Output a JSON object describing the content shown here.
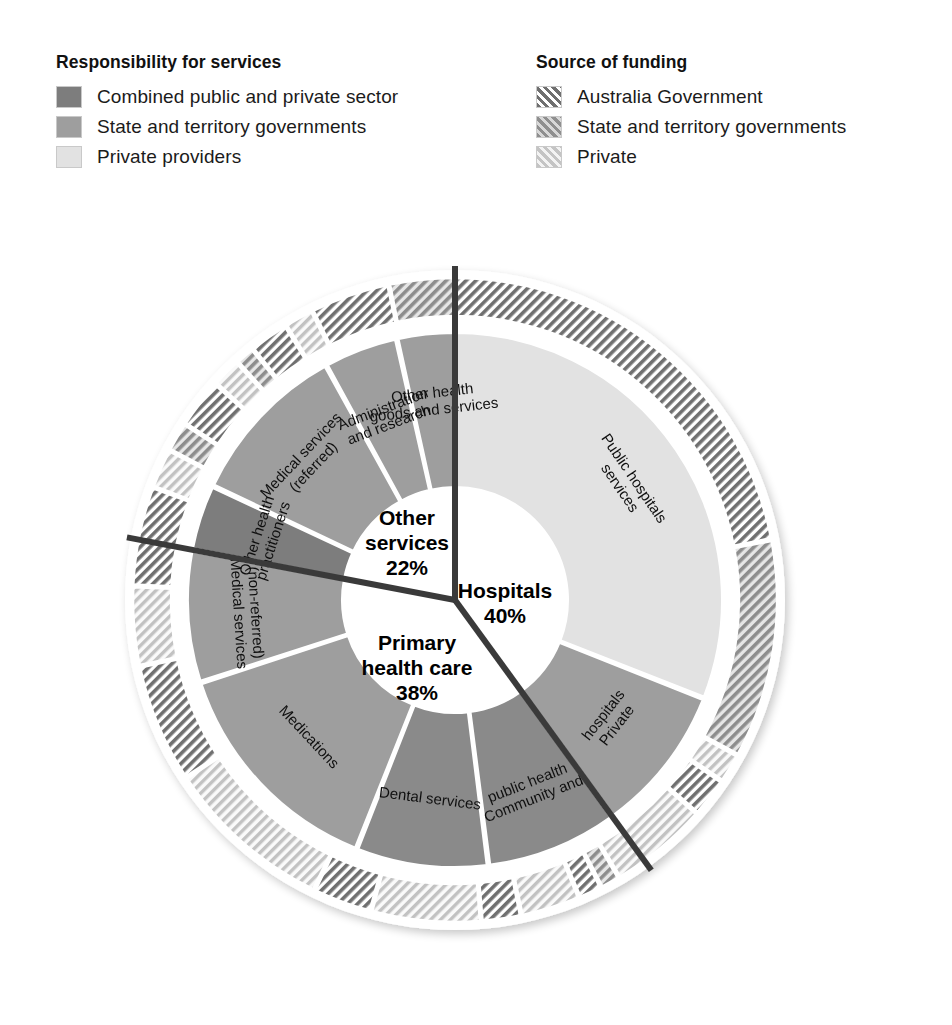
{
  "legends": [
    {
      "id": "responsibility",
      "title": "Responsibility for services",
      "items": [
        {
          "label": "Combined public and private sector",
          "swatch": "dark-gray-solid",
          "color": "#7d7d7d"
        },
        {
          "label": "State and territory governments",
          "swatch": "medium-gray-solid",
          "color": "#9e9e9e"
        },
        {
          "label": "Private providers",
          "swatch": "light-gray-solid",
          "color": "#e2e2e2"
        }
      ]
    },
    {
      "id": "funding",
      "title": "Source of funding",
      "items": [
        {
          "label": "Australia Government",
          "swatch": "dark-gray-hatch",
          "color": "#6f6f6f"
        },
        {
          "label": "State and territory governments",
          "swatch": "medium-gray-hatch",
          "color": "#9a9a9a"
        },
        {
          "label": "Private",
          "swatch": "light-gray-hatch",
          "color": "#dcdcdc"
        }
      ]
    }
  ],
  "chart_data": {
    "type": "pie",
    "title": "",
    "subtype": "sunburst-donut",
    "legend_position": "top",
    "grid": false,
    "center_groups": [
      {
        "name": "Hospitals",
        "value": 40,
        "label": "Hospitals",
        "percent_label": "40%",
        "start_deg": -90,
        "end_deg": 54
      },
      {
        "name": "Primary health care",
        "value": 38,
        "label": "Primary\nhealth care",
        "percent_label": "38%",
        "start_deg": 54,
        "end_deg": 190.8
      },
      {
        "name": "Other services",
        "value": 22,
        "label": "Other\nservices",
        "percent_label": "22%",
        "start_deg": 190.8,
        "end_deg": 270
      }
    ],
    "inner_ring": [
      {
        "label": "Public hospitals services",
        "group": "Hospitals",
        "value": 31.0,
        "responsibility": "State and territory governments",
        "fill": "#e2e2e2"
      },
      {
        "label": "Private hospitals",
        "group": "Hospitals",
        "value": 9.0,
        "responsibility": "Private providers",
        "fill": "#9e9e9e"
      },
      {
        "label": "Community and public health",
        "group": "Primary health care",
        "value": 8.0,
        "responsibility": "Combined public and private sector",
        "fill": "#8a8a8a"
      },
      {
        "label": "Dental services",
        "group": "Primary health care",
        "value": 8.0,
        "responsibility": "Combined public and private sector",
        "fill": "#8a8a8a"
      },
      {
        "label": "Medications",
        "group": "Primary health care",
        "value": 14.0,
        "responsibility": "State and territory governments",
        "fill": "#9e9e9e"
      },
      {
        "label": "Medical services (non-referred)",
        "group": "Primary health care",
        "value": 8.0,
        "responsibility": "State and territory governments",
        "fill": "#9e9e9e"
      },
      {
        "label": "Other health practitioners",
        "group": "Other services",
        "value": 4.0,
        "responsibility": "Combined public and private sector",
        "fill": "#7d7d7d"
      },
      {
        "label": "Medical services (referred)",
        "group": "Other services",
        "value": 10.0,
        "responsibility": "State and territory governments",
        "fill": "#9e9e9e"
      },
      {
        "label": "Administration and research",
        "group": "Other services",
        "value": 4.5,
        "responsibility": "State and territory governments",
        "fill": "#9e9e9e"
      },
      {
        "label": "Other health goods and services",
        "group": "Other services",
        "value": 3.5,
        "responsibility": "State and territory governments",
        "fill": "#9e9e9e"
      }
    ],
    "outer_ring_note": "Funding split per service, hatched bands",
    "outer_ring": [
      {
        "funding": "Australia Government",
        "span": 22.0,
        "fill": "#6f6f6f"
      },
      {
        "funding": "State and territory governments",
        "span": 11.0,
        "fill": "#9a9a9a"
      },
      {
        "funding": "Private",
        "span": 1.5,
        "fill": "#dcdcdc"
      },
      {
        "funding": "Australia Government",
        "span": 2.0,
        "fill": "#6f6f6f"
      },
      {
        "funding": "Private",
        "span": 5.0,
        "fill": "#dcdcdc"
      },
      {
        "funding": "State and territory governments",
        "span": 1.0,
        "fill": "#9a9a9a"
      },
      {
        "funding": "Australia Government",
        "span": 1.2,
        "fill": "#6f6f6f"
      },
      {
        "funding": "Private",
        "span": 3.0,
        "fill": "#dcdcdc"
      },
      {
        "funding": "Australia Government",
        "span": 2.0,
        "fill": "#6f6f6f"
      },
      {
        "funding": "Private",
        "span": 5.5,
        "fill": "#dcdcdc"
      },
      {
        "funding": "Australia Government",
        "span": 3.0,
        "fill": "#6f6f6f"
      },
      {
        "funding": "Private",
        "span": 8.5,
        "fill": "#dcdcdc"
      },
      {
        "funding": "Australia Government",
        "span": 6.0,
        "fill": "#6f6f6f"
      },
      {
        "funding": "Private",
        "span": 4.0,
        "fill": "#dcdcdc"
      },
      {
        "funding": "Australia Government",
        "span": 5.0,
        "fill": "#6f6f6f"
      },
      {
        "funding": "Private",
        "span": 2.0,
        "fill": "#dcdcdc"
      },
      {
        "funding": "State and territory governments",
        "span": 1.5,
        "fill": "#9a9a9a"
      },
      {
        "funding": "Australia Government",
        "span": 2.5,
        "fill": "#6f6f6f"
      },
      {
        "funding": "Private",
        "span": 1.5,
        "fill": "#dcdcdc"
      },
      {
        "funding": "State and territory governments",
        "span": 1.0,
        "fill": "#9a9a9a"
      },
      {
        "funding": "Australia Government",
        "span": 2.0,
        "fill": "#6f6f6f"
      },
      {
        "funding": "Private",
        "span": 1.5,
        "fill": "#dcdcdc"
      },
      {
        "funding": "Australia Government",
        "span": 4.0,
        "fill": "#6f6f6f"
      },
      {
        "funding": "State and territory governments",
        "span": 3.3,
        "fill": "#9a9a9a"
      }
    ]
  }
}
